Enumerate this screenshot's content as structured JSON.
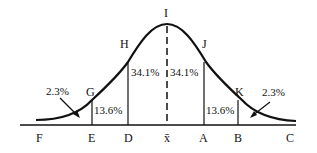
{
  "diagram": {
    "axis_labels": {
      "F": "F",
      "E": "E",
      "D": "D",
      "mean": "x̄",
      "A": "A",
      "B": "B",
      "C": "C"
    },
    "curve_points": {
      "G": "G",
      "H": "H",
      "I": "I",
      "J": "J",
      "K": "K"
    },
    "percentages": {
      "left_tail": "2.3%",
      "left_outer": "13.6%",
      "left_inner": "34.1%",
      "right_inner": "34.1%",
      "right_outer": "13.6%",
      "right_tail": "2.3%"
    }
  }
}
